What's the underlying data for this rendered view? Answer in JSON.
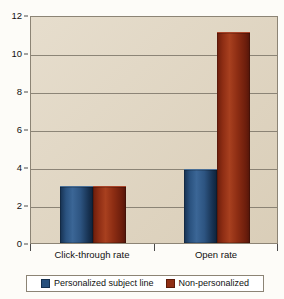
{
  "chart_data": {
    "type": "bar",
    "title": "",
    "subtitle": "",
    "xlabel": "",
    "ylabel": "",
    "categories": [
      "Click-through rate",
      "Open rate"
    ],
    "series": [
      {
        "name": "Personalized subject line",
        "values": [
          3.0,
          3.9
        ],
        "color": "#27507d"
      },
      {
        "name": "Non-personalized",
        "values": [
          3.0,
          11.1
        ],
        "color": "#8f2e14"
      }
    ],
    "ylim": [
      0,
      12
    ],
    "yticks": [
      0,
      2,
      4,
      6,
      8,
      10,
      12
    ],
    "ytick_labels": [
      "0",
      "2",
      "4",
      "6",
      "8",
      "10",
      "12"
    ],
    "grid": true,
    "grid_axis": "y",
    "legend_position": "bottom",
    "plot_background": "#ded2bc",
    "figure_background": "#fdfcf8"
  },
  "legend": {
    "items": [
      {
        "label": "Personalized subject line",
        "swatch": "blue"
      },
      {
        "label": "Non-personalized",
        "swatch": "red"
      }
    ]
  }
}
